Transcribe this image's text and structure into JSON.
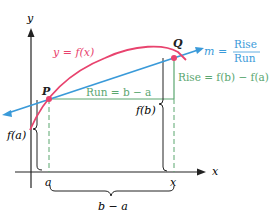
{
  "figure": {
    "axes": {
      "x_label": "x",
      "y_label": "y"
    },
    "curve": {
      "label": "y = f(x)",
      "color": "#e8436e"
    },
    "secant": {
      "label_m": "m =",
      "fraction_num": "Rise",
      "fraction_den": "Run",
      "color": "#3a9ad9"
    },
    "points": {
      "p": "P",
      "q": "Q"
    },
    "run_label": "Run = b − a",
    "rise_label": "Rise = f(b) − f(a)",
    "fa_label": "f(a)",
    "fb_label": "f(b)",
    "x_tick_a": "a",
    "x_tick_x": "x",
    "brace_bottom_label": "b − a",
    "guide_color": "#5aa66f"
  }
}
